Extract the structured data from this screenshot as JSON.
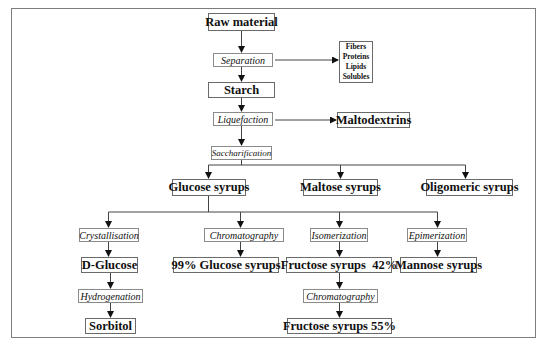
{
  "diagram": {
    "nodes": {
      "raw_material": "Raw material",
      "separation": "Separation",
      "byproducts": [
        "Fibers",
        "Proteins",
        "Lipids",
        "Solubles"
      ],
      "starch": "Starch",
      "liquefaction": "Liquefaction",
      "maltodextrins": "Maltodextrins",
      "saccharification": "Saccharification",
      "glucose_syrups": "Glucose syrups",
      "maltose_syrups": "Maltose syrups",
      "oligomeric_syrups": "Oligomeric syrups",
      "crystallisation": "Crystallisation",
      "chromatography_1": "Chromatography",
      "isomerization": "Isomerization",
      "epimerization": "Epimerization",
      "d_glucose_prefix": "D",
      "d_glucose_suffix": "-Glucose",
      "glucose_99": "99% Glucose syrups",
      "fructose_42": "Fructose syrups  42%",
      "mannose_syrups": "Mannose syrups",
      "hydrogenation": "Hydrogenation",
      "chromatography_2": "Chromatography",
      "sorbitol": "Sorbitol",
      "fructose_55": "Fructose syrups 55%"
    },
    "colors": {
      "line": "#333333",
      "box_border": "#6a6a6a",
      "frame": "#7d7d7d"
    }
  }
}
